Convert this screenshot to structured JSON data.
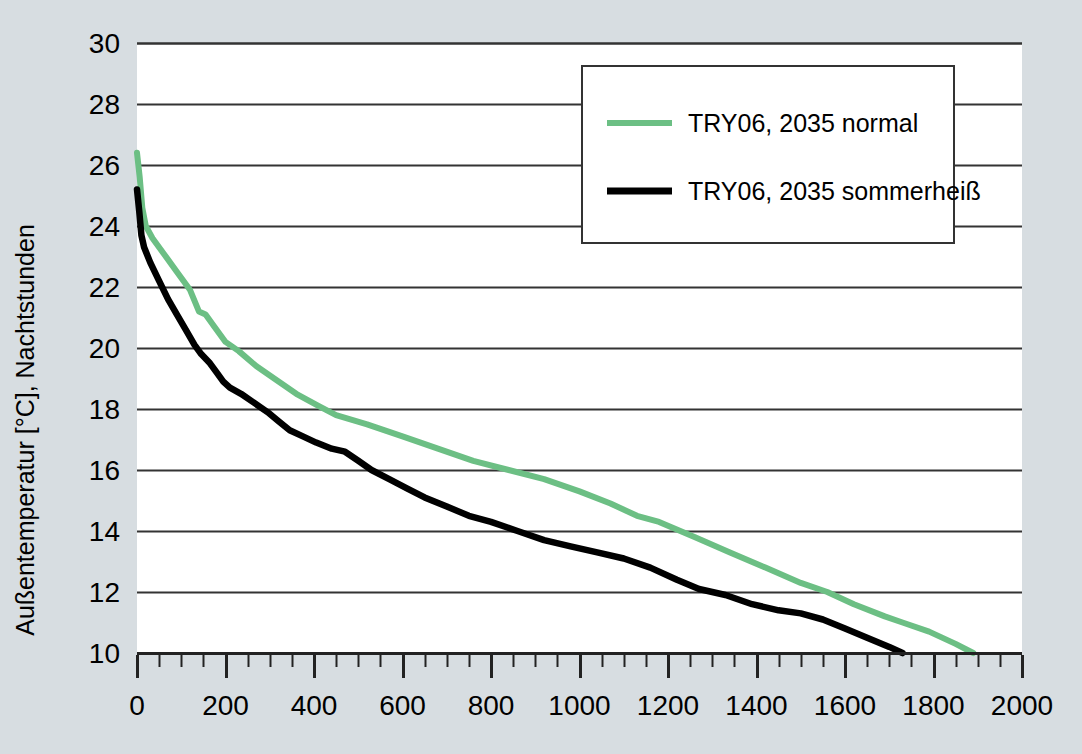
{
  "chart_data": {
    "type": "line",
    "title": "",
    "xlabel": "",
    "ylabel": "Außentemperatur [°C], Nachtstunden",
    "xlim": [
      0,
      2000
    ],
    "ylim": [
      10,
      30
    ],
    "x_ticks": [
      0,
      200,
      400,
      600,
      800,
      1000,
      1200,
      1400,
      1600,
      1800,
      2000
    ],
    "x_minor_step": 50,
    "y_ticks": [
      10,
      12,
      14,
      16,
      18,
      20,
      22,
      24,
      26,
      28,
      30
    ],
    "grid": "horizontal",
    "legend_position": "top-right",
    "series": [
      {
        "name": "TRY06, 2035 normal",
        "color": "#6cbf84",
        "points": [
          [
            0,
            26.4
          ],
          [
            6,
            25.6
          ],
          [
            12,
            24.6
          ],
          [
            20,
            24.0
          ],
          [
            35,
            23.6
          ],
          [
            60,
            23.1
          ],
          [
            90,
            22.5
          ],
          [
            120,
            21.9
          ],
          [
            140,
            21.2
          ],
          [
            155,
            21.1
          ],
          [
            175,
            20.7
          ],
          [
            200,
            20.2
          ],
          [
            230,
            19.9
          ],
          [
            270,
            19.4
          ],
          [
            310,
            19.0
          ],
          [
            360,
            18.5
          ],
          [
            410,
            18.1
          ],
          [
            450,
            17.8
          ],
          [
            520,
            17.5
          ],
          [
            600,
            17.1
          ],
          [
            680,
            16.7
          ],
          [
            760,
            16.3
          ],
          [
            840,
            16.0
          ],
          [
            920,
            15.7
          ],
          [
            1000,
            15.3
          ],
          [
            1070,
            14.9
          ],
          [
            1130,
            14.5
          ],
          [
            1180,
            14.3
          ],
          [
            1260,
            13.8
          ],
          [
            1340,
            13.3
          ],
          [
            1420,
            12.8
          ],
          [
            1500,
            12.3
          ],
          [
            1560,
            12.0
          ],
          [
            1620,
            11.6
          ],
          [
            1690,
            11.2
          ],
          [
            1730,
            11.0
          ],
          [
            1790,
            10.7
          ],
          [
            1850,
            10.3
          ],
          [
            1890,
            10.0
          ]
        ]
      },
      {
        "name": "TRY06, 2035 sommerheiß",
        "color": "#000000",
        "points": [
          [
            0,
            25.2
          ],
          [
            5,
            24.5
          ],
          [
            10,
            23.7
          ],
          [
            16,
            23.3
          ],
          [
            30,
            22.8
          ],
          [
            50,
            22.2
          ],
          [
            70,
            21.6
          ],
          [
            90,
            21.1
          ],
          [
            110,
            20.6
          ],
          [
            130,
            20.1
          ],
          [
            145,
            19.8
          ],
          [
            165,
            19.5
          ],
          [
            180,
            19.2
          ],
          [
            195,
            18.9
          ],
          [
            210,
            18.7
          ],
          [
            235,
            18.5
          ],
          [
            265,
            18.2
          ],
          [
            295,
            17.9
          ],
          [
            320,
            17.6
          ],
          [
            345,
            17.3
          ],
          [
            375,
            17.1
          ],
          [
            405,
            16.9
          ],
          [
            440,
            16.7
          ],
          [
            470,
            16.6
          ],
          [
            500,
            16.3
          ],
          [
            530,
            16.0
          ],
          [
            570,
            15.7
          ],
          [
            610,
            15.4
          ],
          [
            650,
            15.1
          ],
          [
            700,
            14.8
          ],
          [
            750,
            14.5
          ],
          [
            800,
            14.3
          ],
          [
            860,
            14.0
          ],
          [
            920,
            13.7
          ],
          [
            980,
            13.5
          ],
          [
            1040,
            13.3
          ],
          [
            1100,
            13.1
          ],
          [
            1160,
            12.8
          ],
          [
            1220,
            12.4
          ],
          [
            1270,
            12.1
          ],
          [
            1330,
            11.9
          ],
          [
            1390,
            11.6
          ],
          [
            1450,
            11.4
          ],
          [
            1500,
            11.3
          ],
          [
            1550,
            11.1
          ],
          [
            1600,
            10.8
          ],
          [
            1650,
            10.5
          ],
          [
            1700,
            10.2
          ],
          [
            1730,
            10.0
          ]
        ]
      }
    ]
  },
  "legend": {
    "entries": [
      {
        "label": "TRY06, 2035 normal",
        "color": "#6cbf84"
      },
      {
        "label": "TRY06, 2035 sommerheiß",
        "color": "#000000"
      }
    ]
  },
  "axes": {
    "y_title": "Außentemperatur [°C], Nachtstunden",
    "y_tick_labels": [
      "30",
      "28",
      "26",
      "24",
      "22",
      "20",
      "18",
      "16",
      "14",
      "12",
      "10"
    ],
    "x_tick_labels": [
      "0",
      "200",
      "400",
      "600",
      "800",
      "1000",
      "1200",
      "1400",
      "1600",
      "1800",
      "2000"
    ]
  },
  "colors": {
    "background": "#d7dde1",
    "plot_background": "#ffffff",
    "gridline": "#333333",
    "axis": "#222222",
    "series_normal": "#6cbf84",
    "series_sommerheiss": "#000000"
  }
}
